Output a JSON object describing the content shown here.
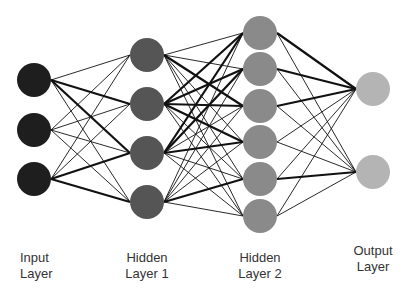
{
  "layers": [
    {
      "name": "Input Layer",
      "line1": "Input",
      "line2": "Layer",
      "nodes": 3,
      "color": "#1e1e1e"
    },
    {
      "name": "Hidden Layer 1",
      "line1": "Hidden",
      "line2": "Layer 1",
      "nodes": 4,
      "color": "#555555"
    },
    {
      "name": "Hidden Layer 2",
      "line1": "Hidden",
      "line2": "Layer 2",
      "nodes": 6,
      "color": "#8a8a8a"
    },
    {
      "name": "Output Layer",
      "line1": "Output",
      "line2": "Layer",
      "nodes": 2,
      "color": "#b4b4b4"
    }
  ],
  "connectivity": "fully-connected",
  "thick_edges": [
    [
      [
        0,
        1
      ],
      [
        0,
        2
      ],
      [
        2,
        2
      ],
      [
        2,
        3
      ]
    ],
    [
      [
        1,
        1
      ],
      [
        1,
        2
      ],
      [
        1,
        3
      ],
      [
        2,
        0
      ],
      [
        2,
        1
      ],
      [
        2,
        3
      ],
      [
        3,
        4
      ],
      [
        1,
        0
      ],
      [
        0,
        2
      ]
    ],
    [
      [
        0,
        0
      ],
      [
        1,
        0
      ],
      [
        2,
        0
      ],
      [
        4,
        1
      ]
    ]
  ],
  "edge_color": "#111111"
}
